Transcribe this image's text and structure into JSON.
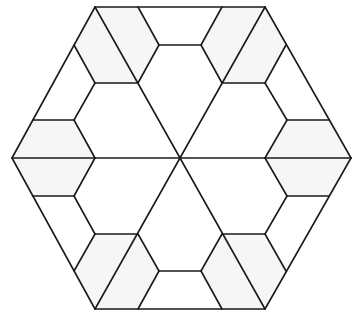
{
  "diagram": {
    "colors": {
      "stroke": "#1a1a1a",
      "background": "#ffffff",
      "hex_fill": "#f6f6f6"
    },
    "outer_hexagon": [
      [
        95,
        7
      ],
      [
        265,
        7
      ],
      [
        351,
        158
      ],
      [
        265,
        309
      ],
      [
        95,
        309
      ],
      [
        12,
        158
      ]
    ],
    "center": [
      180,
      158
    ],
    "small_hexagons": [
      [
        [
          95,
          7
        ],
        [
          138,
          7
        ],
        [
          159,
          45
        ],
        [
          138,
          83
        ],
        [
          95,
          83
        ],
        [
          74,
          45
        ]
      ],
      [
        [
          222,
          7
        ],
        [
          265,
          7
        ],
        [
          286,
          45
        ],
        [
          265,
          83
        ],
        [
          222,
          83
        ],
        [
          201,
          45
        ]
      ],
      [
        [
          33,
          120
        ],
        [
          74,
          120
        ],
        [
          95,
          158
        ],
        [
          74,
          196
        ],
        [
          33,
          196
        ],
        [
          12,
          158
        ]
      ],
      [
        [
          287,
          120
        ],
        [
          329,
          120
        ],
        [
          351,
          158
        ],
        [
          329,
          196
        ],
        [
          287,
          196
        ],
        [
          265,
          158
        ]
      ],
      [
        [
          95,
          234
        ],
        [
          138,
          234
        ],
        [
          159,
          271
        ],
        [
          138,
          309
        ],
        [
          95,
          309
        ],
        [
          74,
          271
        ]
      ],
      [
        [
          222,
          234
        ],
        [
          265,
          234
        ],
        [
          286,
          271
        ],
        [
          265,
          309
        ],
        [
          222,
          309
        ],
        [
          201,
          271
        ]
      ],
      [
        [
          159,
          45
        ],
        [
          201,
          45
        ],
        [
          222,
          83
        ],
        [
          180,
          158
        ],
        [
          138,
          83
        ]
      ],
      [
        [
          95,
          158
        ],
        [
          180,
          158
        ],
        [
          138,
          234
        ],
        [
          95,
          234
        ],
        [
          74,
          196
        ]
      ],
      [
        [
          180,
          158
        ],
        [
          265,
          158
        ],
        [
          287,
          196
        ],
        [
          265,
          234
        ],
        [
          222,
          234
        ]
      ]
    ],
    "segments": [
      [
        [
          95,
          7
        ],
        [
          265,
          7
        ]
      ],
      [
        [
          265,
          7
        ],
        [
          351,
          158
        ]
      ],
      [
        [
          351,
          158
        ],
        [
          265,
          309
        ]
      ],
      [
        [
          265,
          309
        ],
        [
          95,
          309
        ]
      ],
      [
        [
          95,
          309
        ],
        [
          12,
          158
        ]
      ],
      [
        [
          12,
          158
        ],
        [
          95,
          7
        ]
      ],
      [
        [
          95,
          7
        ],
        [
          265,
          309
        ]
      ],
      [
        [
          265,
          7
        ],
        [
          95,
          309
        ]
      ],
      [
        [
          12,
          158
        ],
        [
          351,
          158
        ]
      ],
      [
        [
          138,
          7
        ],
        [
          159,
          45
        ]
      ],
      [
        [
          159,
          45
        ],
        [
          138,
          83
        ]
      ],
      [
        [
          95,
          83
        ],
        [
          138,
          83
        ]
      ],
      [
        [
          95,
          83
        ],
        [
          74,
          45
        ]
      ],
      [
        [
          159,
          45
        ],
        [
          201,
          45
        ]
      ],
      [
        [
          201,
          45
        ],
        [
          222,
          7
        ]
      ],
      [
        [
          201,
          45
        ],
        [
          222,
          83
        ]
      ],
      [
        [
          222,
          83
        ],
        [
          265,
          83
        ]
      ],
      [
        [
          265,
          83
        ],
        [
          286,
          45
        ]
      ],
      [
        [
          95,
          83
        ],
        [
          74,
          120
        ]
      ],
      [
        [
          33,
          120
        ],
        [
          74,
          120
        ]
      ],
      [
        [
          74,
          120
        ],
        [
          95,
          158
        ]
      ],
      [
        [
          265,
          83
        ],
        [
          287,
          120
        ]
      ],
      [
        [
          287,
          120
        ],
        [
          329,
          120
        ]
      ],
      [
        [
          287,
          120
        ],
        [
          265,
          158
        ]
      ],
      [
        [
          95,
          158
        ],
        [
          74,
          196
        ]
      ],
      [
        [
          33,
          196
        ],
        [
          74,
          196
        ]
      ],
      [
        [
          74,
          196
        ],
        [
          95,
          234
        ]
      ],
      [
        [
          74,
          271
        ],
        [
          95,
          234
        ]
      ],
      [
        [
          95,
          234
        ],
        [
          138,
          234
        ]
      ],
      [
        [
          138,
          234
        ],
        [
          159,
          271
        ]
      ],
      [
        [
          159,
          271
        ],
        [
          138,
          309
        ]
      ],
      [
        [
          159,
          271
        ],
        [
          201,
          271
        ]
      ],
      [
        [
          201,
          271
        ],
        [
          222,
          309
        ]
      ],
      [
        [
          201,
          271
        ],
        [
          222,
          234
        ]
      ],
      [
        [
          222,
          234
        ],
        [
          265,
          234
        ]
      ],
      [
        [
          265,
          234
        ],
        [
          286,
          271
        ]
      ],
      [
        [
          265,
          234
        ],
        [
          287,
          196
        ]
      ],
      [
        [
          287,
          196
        ],
        [
          329,
          196
        ]
      ],
      [
        [
          287,
          196
        ],
        [
          265,
          158
        ]
      ]
    ]
  }
}
